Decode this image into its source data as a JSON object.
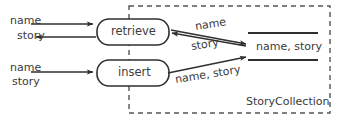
{
  "diagram": {
    "type": "data-flow-diagram",
    "colors": {
      "stroke": "#2f2f2f",
      "text": "#3a3a3a",
      "background": "#ffffff",
      "boundary": "#555555"
    },
    "boundary": {
      "label": "StoryCollection",
      "style": "dashed"
    },
    "processes": [
      {
        "id": "retrieve",
        "label": "retrieve"
      },
      {
        "id": "insert",
        "label": "insert"
      }
    ],
    "datastore": {
      "label": "name, story",
      "style": "open-ended-two-line"
    },
    "flows": [
      {
        "id": "in-retrieve-name",
        "label": "name",
        "direction": "right"
      },
      {
        "id": "out-retrieve-story",
        "label": "story",
        "direction": "left"
      },
      {
        "id": "in-insert-name",
        "label": "name",
        "direction": "right"
      },
      {
        "id": "in-insert-story",
        "label": "story",
        "direction": "right"
      },
      {
        "id": "retrieve-to-store-name",
        "label": "name",
        "direction": "right"
      },
      {
        "id": "store-to-retrieve-story",
        "label": "story",
        "direction": "left"
      },
      {
        "id": "insert-to-store",
        "label": "name, story",
        "direction": "right"
      }
    ]
  }
}
